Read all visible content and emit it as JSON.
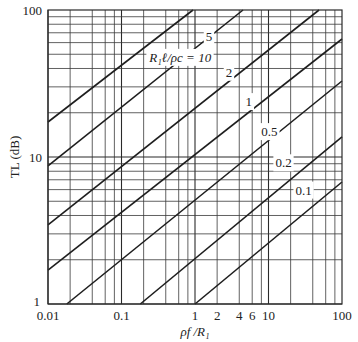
{
  "chart_data": {
    "type": "line",
    "title": "",
    "xlabel": "ρf /R₁",
    "ylabel": "TL (dB)",
    "xscale": "log",
    "yscale": "log",
    "xlim": [
      0.01,
      100
    ],
    "ylim": [
      1,
      100
    ],
    "grid": true,
    "x_tick_labels": [
      {
        "value": 0.01,
        "label": "0.01"
      },
      {
        "value": 0.1,
        "label": "0.1"
      },
      {
        "value": 1,
        "label": "1"
      },
      {
        "value": 2,
        "label": "2"
      },
      {
        "value": 4,
        "label": "4"
      },
      {
        "value": 6,
        "label": "6"
      },
      {
        "value": 10,
        "label": "10"
      },
      {
        "value": 100,
        "label": "100"
      }
    ],
    "y_tick_labels": [
      {
        "value": 1,
        "label": "1"
      },
      {
        "value": 10,
        "label": "10"
      },
      {
        "value": 100,
        "label": "100"
      }
    ],
    "x_minor_grid": [
      2,
      4,
      6,
      8
    ],
    "y_minor_grid": [
      2,
      3,
      4,
      5,
      6,
      7,
      8,
      9
    ],
    "legend_title": "R₁ℓ/ρc",
    "series": [
      {
        "name": "10",
        "label": "R₁ℓ/ρc = 10",
        "points": [
          [
            0.01,
            17.3
          ],
          [
            0.94,
            100
          ]
        ],
        "label_at": [
          0.63,
          48
        ]
      },
      {
        "name": "5",
        "label": "5",
        "points": [
          [
            0.01,
            8.7
          ],
          [
            4.5,
            100
          ]
        ],
        "label_at": [
          1.55,
          67
        ]
      },
      {
        "name": "2",
        "label": "2",
        "points": [
          [
            0.01,
            3.45
          ],
          [
            48.6,
            100
          ]
        ],
        "label_at": [
          2.9,
          38
        ]
      },
      {
        "name": "1",
        "label": "1",
        "points": [
          [
            0.01,
            1.7
          ],
          [
            100,
            63.5
          ]
        ],
        "label_at": [
          5.4,
          24
        ]
      },
      {
        "name": "0.5",
        "label": "0.5",
        "points": [
          [
            0.018,
            1
          ],
          [
            100,
            32.9
          ]
        ],
        "label_at": [
          10.3,
          15
        ]
      },
      {
        "name": "0.2",
        "label": "0.2",
        "points": [
          [
            0.18,
            1
          ],
          [
            100,
            13.7
          ]
        ],
        "label_at": [
          16,
          9.2
        ]
      },
      {
        "name": "0.1",
        "label": "0.1",
        "points": [
          [
            1,
            1
          ],
          [
            100,
            6.76
          ]
        ],
        "label_at": [
          30,
          6.0
        ]
      }
    ]
  }
}
